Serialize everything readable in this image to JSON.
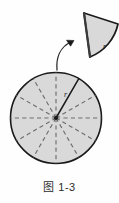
{
  "figure": {
    "caption": "图 1-3",
    "colors": {
      "fill": "#d9d9d9",
      "stroke": "#1a1a1a",
      "dashed": "#777777",
      "background": "#fefefe",
      "caption_text": "#2b2b2b"
    },
    "circle": {
      "center_x": 56,
      "center_y": 118,
      "radius": 46,
      "sector_count": 12,
      "radius_label": "r",
      "radius_label_x": 66,
      "radius_label_y": 94,
      "solid_radius_angle_deg": 60
    },
    "cut_sector": {
      "radius_label": "r",
      "radius_label_x": 105,
      "radius_label_y": 47,
      "apex_x": 84,
      "apex_y": 13
    },
    "arrow": {
      "name": "curved-motion-arrow",
      "from_x": 58,
      "from_y": 68,
      "to_x": 74,
      "to_y": 41
    }
  }
}
